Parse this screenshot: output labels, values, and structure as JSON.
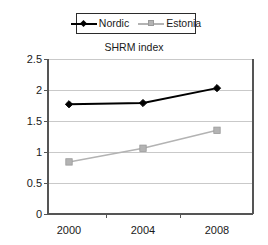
{
  "chart_data": {
    "type": "line",
    "title": "SHRM index",
    "xlabel": "",
    "ylabel": "",
    "categories": [
      "2000",
      "2004",
      "2008"
    ],
    "x": [
      2000,
      2004,
      2008
    ],
    "series": [
      {
        "name": "Nordic",
        "values": [
          1.77,
          1.79,
          2.03
        ],
        "color": "#000000",
        "marker": "diamond"
      },
      {
        "name": "Estonia",
        "values": [
          0.84,
          1.06,
          1.35
        ],
        "color": "#b3b3b3",
        "marker": "square"
      }
    ],
    "ylim": [
      0,
      2.5
    ],
    "yticks": [
      "0",
      "0.5",
      "1",
      "1.5",
      "2",
      "2.5"
    ],
    "ytick_values": [
      0,
      0.5,
      1,
      1.5,
      2,
      2.5
    ],
    "xticks": [
      "2000",
      "2004",
      "2008"
    ],
    "grid": "horizontal",
    "legend_position": "top-center",
    "legend_border": true,
    "axis_color": "#555555",
    "grid_color": "#c9c9c9",
    "background": "#ffffff"
  },
  "legend": {
    "entries": [
      {
        "label": "Nordic"
      },
      {
        "label": "Estonia"
      }
    ]
  }
}
